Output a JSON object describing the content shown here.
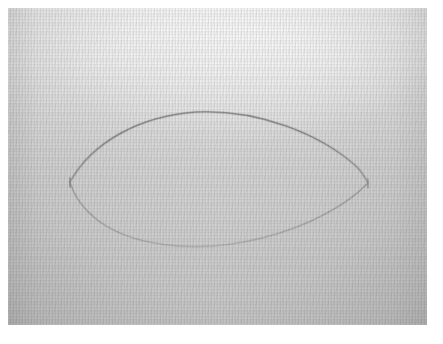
{
  "document": {
    "type": "scanned-photograph",
    "subject": "hand-drawn lens (vesica piscis) outline on textured paper",
    "caption": "Hand-drawn lens shape formed by two opposing arcs meeting at left and right cusps",
    "width_px": 443,
    "height_px": 344
  },
  "border": {
    "name": "white-scan-margin",
    "color": "#ffffff",
    "left_px": 8,
    "top_px": 8,
    "right_px": 16,
    "bottom_px": 19
  },
  "paper": {
    "name": "textured-paper-sheet",
    "x": 8,
    "y": 8,
    "width": 419,
    "height": 317,
    "tone_top": "#f4f4f4",
    "tone_mid": "#d4d4d4",
    "tone_bottom": "#c3c3c3",
    "texture": "fine woven canvas grain with scan banding"
  },
  "drawing": {
    "name": "lens-outline",
    "stroke_color": "#8e8e8e",
    "stroke_color_faint": "#a8a8a8",
    "stroke_width": 1.4,
    "left_cusp": {
      "x": 70,
      "y": 182
    },
    "right_cusp": {
      "x": 368,
      "y": 183
    },
    "top_apex": {
      "x": 212,
      "y": 113
    },
    "bottom_apex": {
      "x": 215,
      "y": 246
    },
    "width_px": 298,
    "height_px": 133,
    "upper_arc_label": "upper arc",
    "lower_arc_label": "lower arc",
    "upper_arc_path": "M 70 182 C 92 142, 140 116, 196 112 C 258 109, 320 134, 356 166 C 361 171, 365 177, 368 183",
    "lower_arc_path": "M 70 182 C 74 196, 84 210, 100 222 C 140 250, 208 252, 262 238 C 310 226, 348 204, 368 183"
  }
}
